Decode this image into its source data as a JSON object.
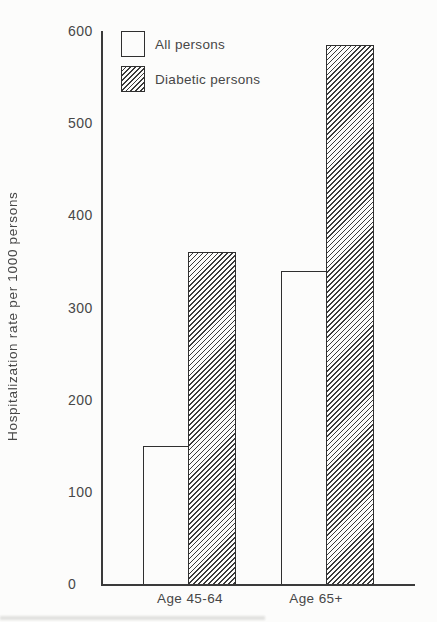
{
  "figure": {
    "background": "#fcfcfb",
    "ink_color": "#3a3a3a",
    "text_color": "#474747"
  },
  "chart_data": {
    "type": "bar",
    "title": "",
    "xlabel": "",
    "ylabel": "Hospitalization rate per 1000 persons",
    "categories": [
      "Age 45-64",
      "Age 65+"
    ],
    "series": [
      {
        "name": "All persons",
        "pattern": "solid-white",
        "values": [
          150,
          340
        ]
      },
      {
        "name": "Diabetic persons",
        "pattern": "diagonal-hatch",
        "values": [
          360,
          585
        ]
      }
    ],
    "ylim": [
      0,
      600
    ],
    "yticks": [
      0,
      100,
      200,
      300,
      400,
      500,
      600
    ],
    "grid": false,
    "legend_position": "top-left-inside",
    "bar_outline_color": "#2f2f2f",
    "hatch_line_color": "#3a3a3a"
  }
}
